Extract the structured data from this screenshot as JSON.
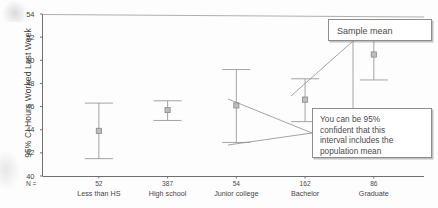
{
  "chart_data": {
    "type": "scatter",
    "title": "",
    "subtitle": "",
    "xlabel": "",
    "ylabel": "95% CI  Hours Worked Last Week",
    "ylim": [
      40,
      54
    ],
    "yticks": [
      40,
      42,
      44,
      46,
      48,
      50,
      52,
      54
    ],
    "ytick_labels": [
      "40",
      "42",
      "44",
      "46",
      "48",
      "50",
      "52",
      "54"
    ],
    "grid": false,
    "legend": "none",
    "categories": [
      "Less than HS",
      "High school",
      "Junior college",
      "Bachelor",
      "Graduate"
    ],
    "n_prefix": "N =",
    "n_values": [
      "52",
      "387",
      "54",
      "162",
      "86"
    ],
    "series": [
      {
        "name": "Mean hours worked last week",
        "values": [
          43.9,
          45.7,
          46.1,
          46.6,
          50.5
        ],
        "ci_lower": [
          41.5,
          44.8,
          42.9,
          44.7,
          48.3
        ],
        "ci_upper": [
          46.3,
          46.5,
          49.2,
          48.4,
          52.5
        ]
      }
    ],
    "annotations": [
      {
        "id": "sample-mean",
        "text": "Sample mean",
        "points_to": "Graduate mean marker"
      },
      {
        "id": "confidence-interval",
        "text": "You can be 95% confident that this interval includes the population mean",
        "lines": [
          "You can be 95%",
          "confident that this",
          "interval includes the",
          "population mean"
        ],
        "points_to": "Bachelor interval whiskers"
      }
    ]
  },
  "colors": {
    "axis": "#6f6f6f",
    "marker": "#8a8a8a",
    "errorbar": "#9a9a9a",
    "callout_border": "#8d8d8d",
    "text": "#444444",
    "background": "#fdfdfd"
  }
}
